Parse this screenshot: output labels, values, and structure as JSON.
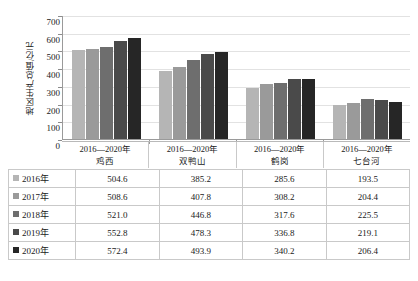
{
  "chart_data": {
    "type": "bar",
    "title": "",
    "xlabel": "",
    "ylabel": "地区生产总值/亿元",
    "ylim": [
      0,
      700
    ],
    "ystep": 100,
    "yticks": [
      "700",
      "600",
      "500",
      "400",
      "300",
      "200",
      "100",
      "0"
    ],
    "grid": true,
    "legend_position": "table-left-column",
    "categories": [
      "鸡西",
      "双鸭山",
      "鹤岗",
      "七台河"
    ],
    "category_range_label": "2016—2020年",
    "series": [
      {
        "name": "2016年",
        "color": "#b5b5b5",
        "values": [
          504.6,
          385.2,
          285.6,
          193.5
        ]
      },
      {
        "name": "2017年",
        "color": "#9a9a9a",
        "values": [
          508.6,
          407.8,
          308.2,
          204.4
        ]
      },
      {
        "name": "2018年",
        "color": "#6e6e6e",
        "values": [
          521.0,
          446.8,
          317.6,
          225.5
        ]
      },
      {
        "name": "2019年",
        "color": "#4a4a4a",
        "values": [
          552.8,
          478.3,
          336.8,
          219.1
        ]
      },
      {
        "name": "2020年",
        "color": "#262626",
        "values": [
          572.4,
          493.9,
          340.2,
          206.4
        ]
      }
    ]
  },
  "table": {
    "rows": [
      {
        "label": "2016年",
        "color": "#b5b5b5",
        "cells": [
          "504.6",
          "385.2",
          "285.6",
          "193.5"
        ]
      },
      {
        "label": "2017年",
        "color": "#9a9a9a",
        "cells": [
          "508.6",
          "407.8",
          "308.2",
          "204.4"
        ]
      },
      {
        "label": "2018年",
        "color": "#6e6e6e",
        "cells": [
          "521.0",
          "446.8",
          "317.6",
          "225.5"
        ]
      },
      {
        "label": "2019年",
        "color": "#4a4a4a",
        "cells": [
          "552.8",
          "478.3",
          "336.8",
          "219.1"
        ]
      },
      {
        "label": "2020年",
        "color": "#262626",
        "cells": [
          "572.4",
          "493.9",
          "340.2",
          "206.4"
        ]
      }
    ]
  },
  "colors": {
    "gridline": "#e2e2e2",
    "axis": "#9a9a9a",
    "table_border": "#c9c9c9",
    "background": "#ffffff",
    "text": "#1a1a1a"
  }
}
